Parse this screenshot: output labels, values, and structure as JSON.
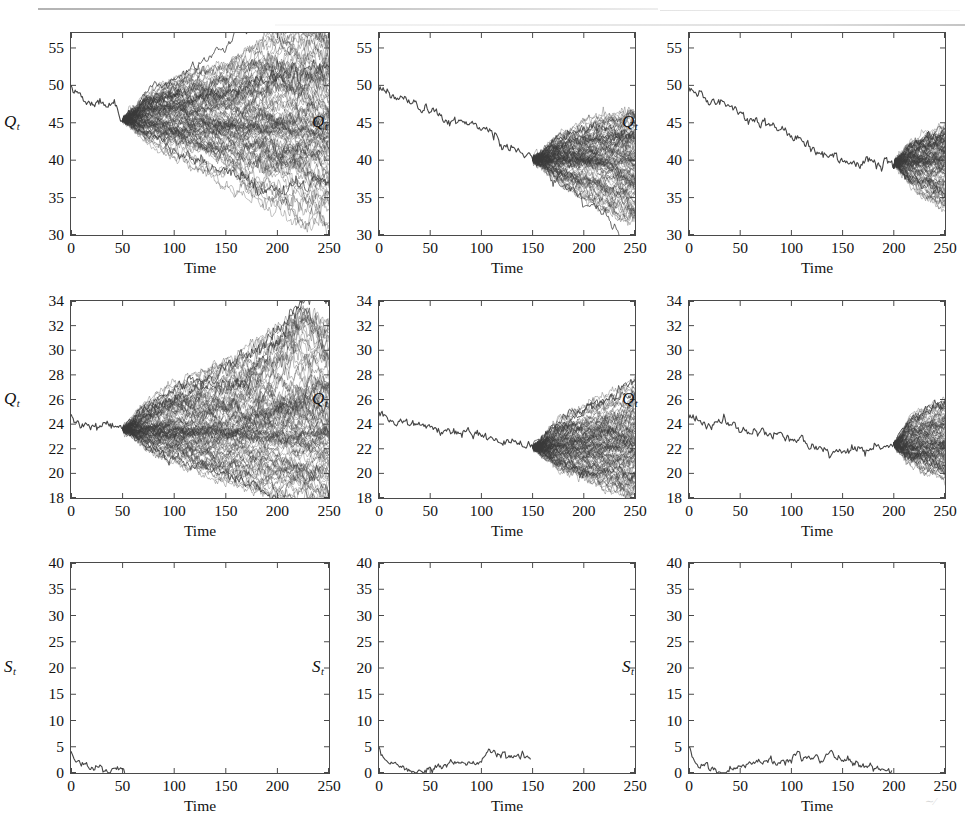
{
  "figure": {
    "title": "",
    "rows": 3,
    "cols": 3,
    "background_color": "#ffffff",
    "axis_color": "#4a4a4a",
    "path_color": "#3a3a3a"
  },
  "labels": {
    "x_axis": "Time",
    "y_axis_q": "Q",
    "y_axis_q_sub": "t",
    "y_axis_s": "S",
    "y_axis_s_sub": "t"
  },
  "axes": {
    "x_ticks": [
      "0",
      "50",
      "100",
      "150",
      "200",
      "250"
    ],
    "x_tick_values": [
      0,
      50,
      100,
      150,
      200,
      250
    ],
    "xlim": [
      0,
      250
    ],
    "row1_y_ticks": [
      "30",
      "35",
      "40",
      "45",
      "50",
      "55"
    ],
    "row1_y_tick_values": [
      30,
      35,
      40,
      45,
      50,
      55
    ],
    "row1_ylim": [
      30,
      57
    ],
    "row2_y_ticks": [
      "18",
      "20",
      "22",
      "24",
      "26",
      "28",
      "30",
      "32",
      "34"
    ],
    "row2_y_tick_values": [
      18,
      20,
      22,
      24,
      26,
      28,
      30,
      32,
      34
    ],
    "row2_ylim": [
      18,
      34
    ],
    "row3_y_ticks": [
      "0",
      "5",
      "10",
      "15",
      "20",
      "25",
      "30",
      "35",
      "40"
    ],
    "row3_y_tick_values": [
      0,
      5,
      10,
      15,
      20,
      25,
      30,
      35,
      40
    ],
    "row3_ylim": [
      0,
      40
    ]
  },
  "chart_data": [
    {
      "id": "panel-r1c1",
      "type": "line",
      "title": "",
      "xlabel": "Time",
      "ylabel": "Q_t",
      "xlim": [
        0,
        250
      ],
      "ylim": [
        30,
        57
      ],
      "grid": false,
      "legend": "none",
      "fan_start_time": 50,
      "n_paths": 100,
      "history": {
        "x": [
          0,
          5,
          10,
          15,
          20,
          25,
          30,
          35,
          40,
          45,
          50
        ],
        "y": [
          49.6,
          48.9,
          48.5,
          48.0,
          47.4,
          47.8,
          47.9,
          47.2,
          47.6,
          46.4,
          45.4
        ]
      },
      "fan_envelope": {
        "x": [
          50,
          75,
          100,
          125,
          150,
          175,
          200,
          225,
          250
        ],
        "upper": [
          45.4,
          48.6,
          50.0,
          51.0,
          51.6,
          53.6,
          55.2,
          55.9,
          54.6
        ],
        "lower": [
          45.4,
          42.6,
          40.8,
          39.2,
          37.6,
          35.6,
          34.4,
          33.2,
          32.2
        ],
        "median": [
          45.4,
          45.4,
          45.3,
          45.0,
          44.6,
          44.4,
          44.2,
          44.0,
          43.6
        ]
      }
    },
    {
      "id": "panel-r1c2",
      "type": "line",
      "title": "",
      "xlabel": "Time",
      "ylabel": "Q_t",
      "xlim": [
        0,
        250
      ],
      "ylim": [
        30,
        57
      ],
      "grid": false,
      "legend": "none",
      "fan_start_time": 150,
      "n_paths": 100,
      "history": {
        "x": [
          0,
          15,
          30,
          45,
          60,
          75,
          90,
          105,
          120,
          135,
          150
        ],
        "y": [
          49.9,
          48.3,
          47.5,
          46.8,
          45.9,
          45.1,
          45.0,
          44.2,
          42.4,
          41.4,
          40.1
        ]
      },
      "fan_envelope": {
        "x": [
          150,
          175,
          200,
          225,
          250
        ],
        "upper": [
          40.1,
          43.0,
          44.4,
          45.4,
          45.6
        ],
        "lower": [
          40.1,
          37.4,
          35.6,
          34.0,
          32.5
        ],
        "median": [
          40.1,
          40.2,
          40.0,
          39.8,
          39.6
        ]
      }
    },
    {
      "id": "panel-r1c3",
      "type": "line",
      "title": "",
      "xlabel": "Time",
      "ylabel": "Q_t",
      "xlim": [
        0,
        250
      ],
      "ylim": [
        30,
        57
      ],
      "grid": false,
      "legend": "none",
      "fan_start_time": 200,
      "n_paths": 100,
      "history": {
        "x": [
          0,
          20,
          40,
          60,
          80,
          100,
          120,
          140,
          160,
          180,
          200
        ],
        "y": [
          49.9,
          47.9,
          47.2,
          45.0,
          44.6,
          43.4,
          41.6,
          40.6,
          39.6,
          39.6,
          39.6
        ]
      },
      "fan_envelope": {
        "x": [
          200,
          215,
          230,
          250
        ],
        "upper": [
          39.6,
          42.1,
          43.1,
          44.4
        ],
        "lower": [
          39.6,
          37.1,
          35.8,
          34.3
        ],
        "median": [
          39.6,
          39.8,
          39.9,
          40.0
        ]
      }
    },
    {
      "id": "panel-r2c1",
      "type": "line",
      "title": "",
      "xlabel": "Time",
      "ylabel": "Q_t",
      "xlim": [
        0,
        250
      ],
      "ylim": [
        18,
        34
      ],
      "grid": false,
      "legend": "none",
      "fan_start_time": 50,
      "n_paths": 100,
      "history": {
        "x": [
          0,
          5,
          10,
          15,
          20,
          25,
          30,
          35,
          40,
          45,
          50
        ],
        "y": [
          24.6,
          24.2,
          24.0,
          23.8,
          23.9,
          23.7,
          23.8,
          24.0,
          24.1,
          23.7,
          23.6
        ]
      },
      "fan_envelope": {
        "x": [
          50,
          75,
          100,
          125,
          150,
          175,
          200,
          225,
          250
        ],
        "upper": [
          23.6,
          25.7,
          26.8,
          27.6,
          28.4,
          29.5,
          30.6,
          31.9,
          31.0
        ],
        "lower": [
          23.6,
          22.0,
          21.2,
          20.5,
          19.9,
          19.4,
          19.0,
          18.6,
          18.2
        ],
        "median": [
          23.6,
          23.6,
          23.5,
          23.5,
          23.4,
          23.4,
          23.3,
          23.3,
          23.2
        ]
      }
    },
    {
      "id": "panel-r2c2",
      "type": "line",
      "title": "",
      "xlabel": "Time",
      "ylabel": "Q_t",
      "xlim": [
        0,
        250
      ],
      "ylim": [
        18,
        34
      ],
      "grid": false,
      "legend": "none",
      "fan_start_time": 150,
      "n_paths": 100,
      "history": {
        "x": [
          0,
          15,
          30,
          45,
          60,
          75,
          90,
          105,
          120,
          135,
          150
        ],
        "y": [
          24.7,
          24.0,
          24.1,
          23.9,
          23.3,
          23.4,
          23.5,
          23.0,
          22.5,
          22.6,
          22.1
        ]
      },
      "fan_envelope": {
        "x": [
          150,
          175,
          200,
          225,
          250
        ],
        "upper": [
          22.1,
          24.2,
          25.2,
          26.0,
          26.8
        ],
        "lower": [
          22.1,
          20.6,
          19.8,
          19.1,
          18.5
        ],
        "median": [
          22.1,
          22.2,
          22.2,
          22.2,
          22.2
        ]
      }
    },
    {
      "id": "panel-r2c3",
      "type": "line",
      "title": "",
      "xlabel": "Time",
      "ylabel": "Q_t",
      "xlim": [
        0,
        250
      ],
      "ylim": [
        18,
        34
      ],
      "grid": false,
      "legend": "none",
      "fan_start_time": 200,
      "n_paths": 100,
      "history": {
        "x": [
          0,
          20,
          40,
          60,
          80,
          100,
          120,
          140,
          160,
          180,
          200
        ],
        "y": [
          24.6,
          23.9,
          24.0,
          23.2,
          23.5,
          22.8,
          22.2,
          21.8,
          22.0,
          21.9,
          22.3
        ]
      },
      "fan_envelope": {
        "x": [
          200,
          215,
          230,
          250
        ],
        "upper": [
          22.3,
          24.2,
          24.8,
          25.5
        ],
        "lower": [
          22.3,
          21.0,
          20.5,
          20.0
        ],
        "median": [
          22.3,
          22.4,
          22.5,
          22.5
        ]
      }
    },
    {
      "id": "panel-r3c1",
      "type": "line",
      "title": "",
      "xlabel": "Time",
      "ylabel": "S_t",
      "xlim": [
        0,
        250
      ],
      "ylim": [
        0,
        40
      ],
      "grid": false,
      "legend": "none",
      "series_end_time": 52,
      "x": [
        0,
        2,
        4,
        6,
        8,
        10,
        13,
        16,
        19,
        22,
        25,
        28,
        31,
        34,
        37,
        40,
        43,
        46,
        49,
        52
      ],
      "y": [
        4.3,
        3.1,
        2.4,
        1.9,
        2.0,
        1.3,
        1.8,
        1.5,
        0.7,
        0.8,
        1.1,
        0.6,
        0.4,
        0.5,
        0.4,
        0.6,
        0.9,
        0.6,
        0.9,
        0.3
      ]
    },
    {
      "id": "panel-r3c2",
      "type": "line",
      "title": "",
      "xlabel": "Time",
      "ylabel": "S_t",
      "xlim": [
        0,
        250
      ],
      "ylim": [
        0,
        40
      ],
      "grid": false,
      "legend": "none",
      "series_end_time": 148,
      "x": [
        0,
        5,
        10,
        15,
        20,
        25,
        30,
        35,
        40,
        45,
        50,
        60,
        70,
        80,
        85,
        90,
        95,
        100,
        105,
        110,
        115,
        120,
        125,
        130,
        135,
        140,
        145,
        148
      ],
      "y": [
        4.6,
        2.3,
        1.6,
        2.1,
        1.2,
        0.8,
        0.3,
        0.2,
        0.5,
        0.4,
        0.9,
        1.4,
        2.0,
        2.4,
        1.9,
        2.1,
        1.7,
        2.2,
        3.6,
        4.5,
        3.2,
        3.6,
        2.9,
        3.4,
        2.5,
        3.6,
        3.4,
        2.9
      ]
    },
    {
      "id": "panel-r3c3",
      "type": "line",
      "title": "",
      "xlabel": "Time",
      "ylabel": "S_t",
      "xlim": [
        0,
        250
      ],
      "ylim": [
        0,
        40
      ],
      "grid": false,
      "legend": "none",
      "series_end_time": 198,
      "x": [
        0,
        5,
        10,
        15,
        20,
        25,
        30,
        35,
        40,
        45,
        50,
        60,
        70,
        80,
        85,
        90,
        95,
        100,
        105,
        110,
        115,
        120,
        125,
        130,
        135,
        140,
        145,
        150,
        160,
        170,
        180,
        190,
        198
      ],
      "y": [
        4.5,
        2.2,
        1.3,
        2.2,
        1.3,
        0.6,
        0.2,
        0.3,
        0.5,
        0.9,
        1.3,
        1.7,
        2.3,
        2.5,
        1.8,
        2.0,
        1.9,
        2.3,
        4.2,
        3.2,
        3.6,
        2.8,
        3.3,
        2.4,
        3.6,
        4.1,
        2.9,
        2.4,
        1.8,
        1.5,
        1.0,
        0.3,
        0.1
      ]
    }
  ]
}
